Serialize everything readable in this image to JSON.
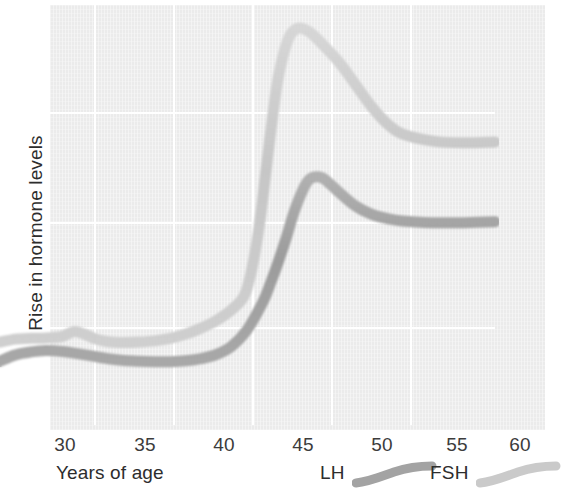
{
  "chart_data": {
    "type": "line",
    "title": "",
    "xlabel": "Years of age",
    "ylabel": "Rise in hormone levels",
    "xlim": [
      29,
      61
    ],
    "ylim": [
      0,
      100
    ],
    "xticks": [
      "30",
      "35",
      "40",
      "45",
      "50",
      "55",
      "60"
    ],
    "xtick_values": [
      30,
      35,
      40,
      45,
      50,
      55,
      60
    ],
    "yticks": [],
    "grid": "white gridlines, vertical at 35/40/45/50/55 and three horizontal",
    "legend_position": "below axes, right of x-axis title",
    "series": [
      {
        "name": "LH",
        "color": "#a3a3a3",
        "x": [
          29.0,
          30.0,
          31.0,
          32.0,
          33.0,
          34.0,
          35.0,
          36.0,
          37.0,
          38.0,
          39.0,
          40.0,
          41.0,
          42.0,
          43.0,
          44.0,
          45.0,
          46.0,
          46.5,
          47.0,
          47.5,
          48.0,
          48.6,
          49.0,
          49.5,
          50.0,
          51.0,
          52.0,
          53.0,
          54.0,
          55.0,
          57.0,
          59.0,
          61.0
        ],
        "values": [
          15.0,
          16.5,
          17.2,
          17.5,
          17.3,
          16.8,
          16.2,
          15.6,
          15.2,
          15.0,
          14.9,
          14.9,
          15.1,
          15.6,
          16.6,
          18.6,
          22.5,
          29.0,
          33.5,
          38.5,
          44.0,
          50.0,
          55.5,
          57.8,
          58.4,
          57.8,
          54.5,
          51.5,
          49.6,
          48.6,
          48.0,
          47.6,
          47.6,
          47.8
        ]
      },
      {
        "name": "FSH",
        "color": "#cacaca",
        "x": [
          29.0,
          30.0,
          31.0,
          32.0,
          33.0,
          33.8,
          34.5,
          35.2,
          36.0,
          37.0,
          38.0,
          39.0,
          40.0,
          41.0,
          42.0,
          43.0,
          44.0,
          44.8,
          45.3,
          45.8,
          46.2,
          46.6,
          47.0,
          47.6,
          48.2,
          49.0,
          50.0,
          51.0,
          52.0,
          53.0,
          54.0,
          55.0,
          57.0,
          59.0,
          61.0
        ],
        "values": [
          19.5,
          20.2,
          20.4,
          20.5,
          20.8,
          22.0,
          21.3,
          20.2,
          19.6,
          19.4,
          19.5,
          19.8,
          20.4,
          21.4,
          22.8,
          24.6,
          27.2,
          30.5,
          37.0,
          48.0,
          60.0,
          72.0,
          82.0,
          90.5,
          93.3,
          92.5,
          89.0,
          85.0,
          80.0,
          75.0,
          71.0,
          68.5,
          66.8,
          66.4,
          66.6
        ]
      }
    ]
  },
  "axis": {
    "y_title": "Rise in hormone levels",
    "x_title": "Years of age",
    "xticks": [
      "30",
      "35",
      "40",
      "45",
      "50",
      "55",
      "60"
    ]
  },
  "legend": {
    "entries": [
      {
        "label": "LH",
        "color": "#a3a3a3"
      },
      {
        "label": "FSH",
        "color": "#cacaca"
      }
    ]
  },
  "style": {
    "panel_background": "#ebebeb",
    "gridline_color": "#ffffff",
    "text_color": "#2d2d2d",
    "lh_color": "#a3a3a3",
    "fsh_color": "#cacaca"
  }
}
